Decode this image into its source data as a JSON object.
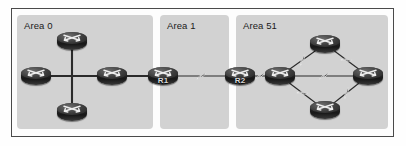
{
  "diagram": {
    "background_color": "#fdfdfd",
    "frame_border_color": "#4a4a4a",
    "panel_color": "#d2d2d2",
    "link_color": "#2a2a2a",
    "areas": [
      {
        "id": "area-0",
        "label": "Area 0",
        "x": 17,
        "y": 15,
        "width": 136,
        "height": 114
      },
      {
        "id": "area-1",
        "label": "Area 1",
        "x": 160,
        "y": 15,
        "width": 69,
        "height": 114
      },
      {
        "id": "area-51",
        "label": "Area 51",
        "x": 236,
        "y": 15,
        "width": 152,
        "height": 114
      }
    ],
    "routers": [
      {
        "id": "a0-top",
        "name": "",
        "x": 72,
        "y": 41
      },
      {
        "id": "a0-left",
        "name": "",
        "x": 36,
        "y": 76
      },
      {
        "id": "a0-bottom",
        "name": "",
        "x": 72,
        "y": 112
      },
      {
        "id": "a0-right",
        "name": "",
        "x": 112,
        "y": 76
      },
      {
        "id": "r1",
        "name": "R1",
        "x": 163,
        "y": 76
      },
      {
        "id": "r2",
        "name": "R2",
        "x": 240,
        "y": 76
      },
      {
        "id": "a51-left",
        "name": "",
        "x": 280,
        "y": 76
      },
      {
        "id": "a51-top",
        "name": "",
        "x": 325,
        "y": 44
      },
      {
        "id": "a51-bottom",
        "name": "",
        "x": 325,
        "y": 110
      },
      {
        "id": "a51-right",
        "name": "",
        "x": 368,
        "y": 76
      }
    ],
    "links": [
      {
        "from": "a0-top",
        "to": "a0-bottom",
        "type": "ethernet"
      },
      {
        "from": "a0-left",
        "to": "a0-right",
        "type": "ethernet"
      },
      {
        "from": "a0-right",
        "to": "r1",
        "type": "ethernet"
      },
      {
        "from": "r1",
        "to": "r2",
        "type": "serial"
      },
      {
        "from": "r2",
        "to": "a51-left",
        "type": "serial"
      },
      {
        "from": "a51-left",
        "to": "a51-top",
        "type": "serial"
      },
      {
        "from": "a51-top",
        "to": "a51-right",
        "type": "serial"
      },
      {
        "from": "a51-left",
        "to": "a51-bottom",
        "type": "serial"
      },
      {
        "from": "a51-bottom",
        "to": "a51-right",
        "type": "serial"
      },
      {
        "from": "a51-left",
        "to": "a51-right",
        "type": "serial"
      }
    ],
    "icon_names": {
      "router": "router-icon",
      "serial_link": "lightning-bolt-serial-link-icon",
      "ethernet_link": "ethernet-link-icon"
    }
  }
}
